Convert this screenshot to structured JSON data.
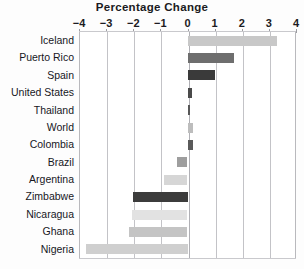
{
  "chart": {
    "title": "Percentage Change",
    "xlabel": "",
    "ylabel": ""
  },
  "axis": {
    "ticks": [
      {
        "label": "−4",
        "value": -4
      },
      {
        "label": "−3",
        "value": -3
      },
      {
        "label": "−2",
        "value": -2
      },
      {
        "label": "−1",
        "value": -1
      },
      {
        "label": "0",
        "value": 0
      },
      {
        "label": "1",
        "value": 1
      },
      {
        "label": "2",
        "value": 2
      },
      {
        "label": "3",
        "value": 3
      },
      {
        "label": "4",
        "value": 4
      }
    ]
  },
  "chart_data": {
    "type": "bar",
    "orientation": "horizontal",
    "title": "Percentage Change",
    "xlabel": "",
    "ylabel": "",
    "xlim": [
      -4,
      4
    ],
    "xticks": [
      -4,
      -3,
      -2,
      -1,
      0,
      1,
      2,
      3,
      4
    ],
    "grid": true,
    "legend": "none",
    "categories": [
      "Iceland",
      "Puerto Rico",
      "Spain",
      "United States",
      "Thailand",
      "World",
      "Colombia",
      "Brazil",
      "Argentina",
      "Zimbabwe",
      "Nicaragua",
      "Ghana",
      "Nigeria"
    ],
    "values": [
      3.3,
      1.7,
      1.0,
      0.15,
      0.1,
      0.2,
      0.2,
      -0.4,
      -0.85,
      -2.0,
      -2.05,
      -2.15,
      -3.75
    ],
    "bar_colors": [
      "#c8c8c8",
      "#6e6e6e",
      "#3a3a3a",
      "#4a4a4a",
      "#575757",
      "#bdbdbd",
      "#5a5a5a",
      "#9e9e9e",
      "#d6d6d6",
      "#3c3c3c",
      "#e2e2e2",
      "#c4c4c4",
      "#cfcfcf"
    ]
  },
  "colors": {
    "background": "#fdfdfd",
    "plot_background": "#ffffff",
    "gridline": "#c3c3c7",
    "text": "#17171d"
  }
}
